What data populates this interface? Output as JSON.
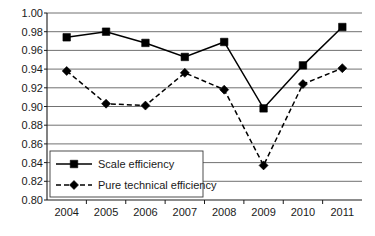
{
  "chart_data": {
    "type": "line",
    "title": "",
    "subtitle": "",
    "xlabel": "",
    "ylabel": "",
    "categories": [
      "2004",
      "2005",
      "2006",
      "2007",
      "2008",
      "2009",
      "2010",
      "2011"
    ],
    "x": [
      2004,
      2005,
      2006,
      2007,
      2008,
      2009,
      2010,
      2011
    ],
    "ylim": [
      0.8,
      1.0
    ],
    "ytick_labels": [
      "1.00",
      "0.98",
      "0.96",
      "0.94",
      "0.92",
      "0.90",
      "0.88",
      "0.86",
      "0.84",
      "0.82",
      "0.80"
    ],
    "ytick_values": [
      1.0,
      0.98,
      0.96,
      0.94,
      0.92,
      0.9,
      0.88,
      0.86,
      0.84,
      0.82,
      0.8
    ],
    "grid": "horizontal",
    "legend_position": "inside-bottom-left",
    "series": [
      {
        "name": "Scale efficiency",
        "marker": "square",
        "line_style": "solid",
        "color": "#000000",
        "values": [
          0.974,
          0.98,
          0.968,
          0.953,
          0.969,
          0.898,
          0.944,
          0.985
        ]
      },
      {
        "name": "Pure technical efficiency",
        "marker": "diamond",
        "line_style": "dashed",
        "color": "#000000",
        "values": [
          0.938,
          0.903,
          0.901,
          0.936,
          0.918,
          0.837,
          0.924,
          0.941
        ]
      }
    ],
    "annotations": []
  },
  "legend": {
    "items": [
      {
        "label": "Scale efficiency"
      },
      {
        "label": "Pure technical efficiency"
      }
    ]
  }
}
